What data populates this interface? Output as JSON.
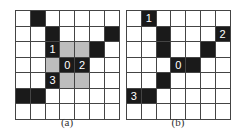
{
  "figure": {
    "panels": [
      {
        "caption": "(a)",
        "rows": 7,
        "cols": 7,
        "legend": {
          "b": "black",
          "g": "gray",
          "w": "white"
        },
        "cells": [
          [
            "w",
            "b",
            "w",
            "w",
            "w",
            "w",
            "w"
          ],
          [
            "w",
            "w",
            "b",
            "w",
            "w",
            "w",
            "b"
          ],
          [
            "w",
            "w",
            "b",
            "g",
            "g",
            "b",
            "w"
          ],
          [
            "w",
            "w",
            "g",
            "b",
            "b",
            "w",
            "w"
          ],
          [
            "w",
            "w",
            "b",
            "g",
            "g",
            "w",
            "w"
          ],
          [
            "b",
            "b",
            "w",
            "w",
            "w",
            "w",
            "w"
          ],
          [
            "w",
            "w",
            "w",
            "w",
            "w",
            "w",
            "w"
          ]
        ],
        "labels": [
          {
            "row": 2,
            "col": 2,
            "text": "1"
          },
          {
            "row": 3,
            "col": 3,
            "text": "0"
          },
          {
            "row": 3,
            "col": 4,
            "text": "2"
          },
          {
            "row": 4,
            "col": 2,
            "text": "3"
          }
        ]
      },
      {
        "caption": "(b)",
        "rows": 7,
        "cols": 7,
        "legend": {
          "b": "black",
          "g": "gray",
          "w": "white"
        },
        "cells": [
          [
            "w",
            "b",
            "w",
            "w",
            "w",
            "w",
            "w"
          ],
          [
            "w",
            "w",
            "b",
            "w",
            "w",
            "w",
            "b"
          ],
          [
            "w",
            "w",
            "b",
            "w",
            "w",
            "b",
            "w"
          ],
          [
            "w",
            "w",
            "w",
            "b",
            "b",
            "w",
            "w"
          ],
          [
            "w",
            "w",
            "b",
            "w",
            "w",
            "w",
            "w"
          ],
          [
            "b",
            "b",
            "w",
            "w",
            "w",
            "w",
            "w"
          ],
          [
            "w",
            "w",
            "w",
            "w",
            "w",
            "w",
            "w"
          ]
        ],
        "labels": [
          {
            "row": 0,
            "col": 1,
            "text": "1"
          },
          {
            "row": 1,
            "col": 6,
            "text": "2"
          },
          {
            "row": 3,
            "col": 3,
            "text": "0"
          },
          {
            "row": 5,
            "col": 0,
            "text": "3"
          }
        ]
      }
    ],
    "colors": {
      "black": "#1a1a1a",
      "gray": "#bdbdbd",
      "white": "#ffffff",
      "grid_line": "#444444"
    }
  }
}
